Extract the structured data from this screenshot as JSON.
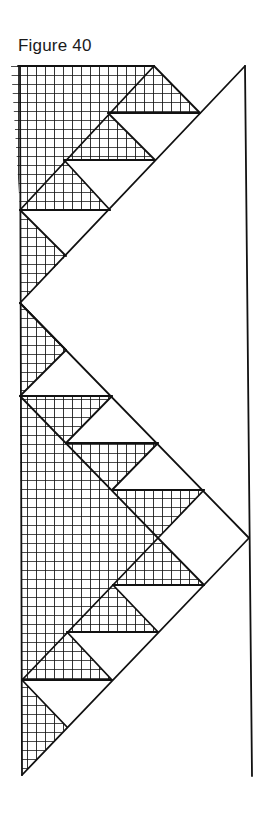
{
  "figure": {
    "title": "Figure 40",
    "colors": {
      "ink": "#111111",
      "background": "#ffffff"
    },
    "grid_cell_px": 9,
    "hatched_regions": [
      "11,66 154,66 20,210",
      "154,66 200,113 108,113",
      "108,113 155,160 64,160",
      "64,160 110,210 20,210",
      "20,210 66,256 20,303",
      "20,303 66,350 20,396",
      "20,396 158,538 22,680",
      "20,396 112,396 66,443",
      "66,443 158,443 112,490",
      "112,490 204,490 158,538",
      "158,538 204,585 113,585",
      "113,585 158,632 67,632",
      "67,632 112,680 22,680",
      "22,680 67,727 22,775"
    ],
    "outline_segments": [
      [
        18,
        66,
        154,
        66
      ],
      [
        154,
        66,
        20,
        210
      ],
      [
        154,
        66,
        200,
        113
      ],
      [
        108,
        113,
        200,
        113
      ],
      [
        108,
        113,
        155,
        160
      ],
      [
        64,
        160,
        155,
        160
      ],
      [
        64,
        160,
        110,
        210
      ],
      [
        20,
        210,
        110,
        210
      ],
      [
        20,
        210,
        66,
        256
      ],
      [
        245,
        66,
        20,
        303
      ],
      [
        20,
        303,
        249,
        538
      ],
      [
        20,
        303,
        66,
        350
      ],
      [
        66,
        350,
        20,
        396
      ],
      [
        20,
        396,
        112,
        396
      ],
      [
        112,
        396,
        66,
        443
      ],
      [
        66,
        443,
        158,
        443
      ],
      [
        158,
        443,
        112,
        490
      ],
      [
        112,
        490,
        204,
        490
      ],
      [
        204,
        490,
        158,
        538
      ],
      [
        20,
        396,
        158,
        538
      ],
      [
        158,
        538,
        22,
        680
      ],
      [
        158,
        538,
        204,
        585
      ],
      [
        113,
        585,
        204,
        585
      ],
      [
        113,
        585,
        158,
        632
      ],
      [
        67,
        632,
        158,
        632
      ],
      [
        67,
        632,
        112,
        680
      ],
      [
        22,
        680,
        112,
        680
      ],
      [
        22,
        680,
        67,
        727
      ],
      [
        249,
        538,
        22,
        775
      ],
      [
        20,
        66,
        22,
        775
      ],
      [
        245,
        66,
        252,
        776
      ]
    ]
  }
}
